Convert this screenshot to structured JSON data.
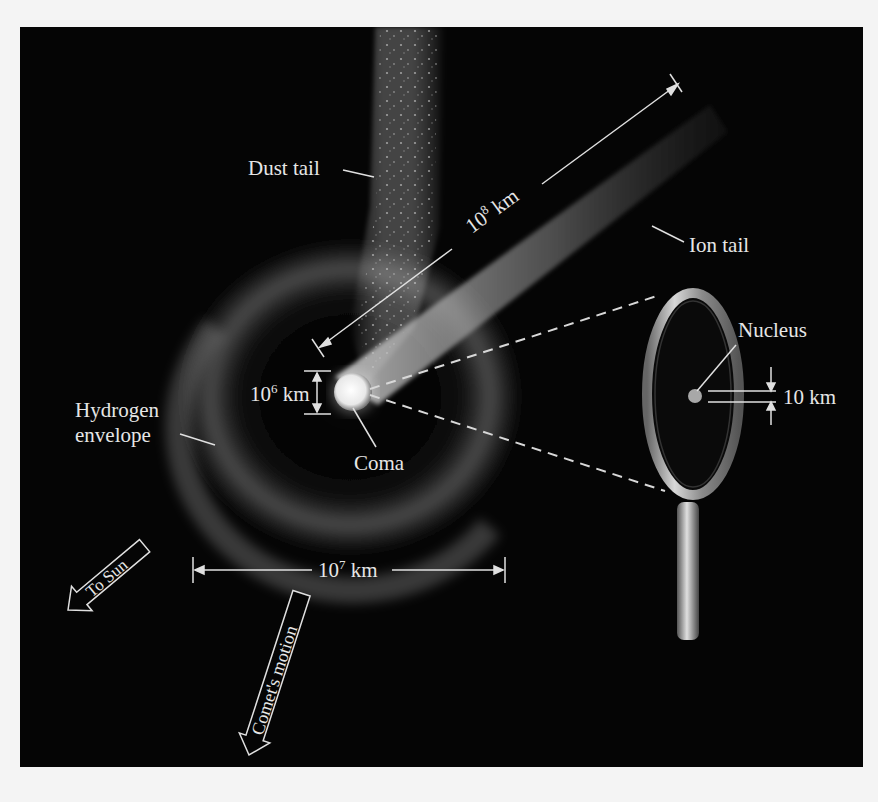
{
  "diagram": {
    "background_color": "#050505",
    "page_color": "#f4f4f4",
    "label_color": "#e6e6e6",
    "labels": {
      "dust_tail": "Dust tail",
      "ion_tail": "Ion tail",
      "hydrogen_envelope_line1": "Hydrogen",
      "hydrogen_envelope_line2": "envelope",
      "coma": "Coma",
      "nucleus": "Nucleus"
    },
    "dimensions": {
      "tail_length": {
        "base": "10",
        "exp": "8",
        "unit": "km"
      },
      "coma_size": {
        "base": "10",
        "exp": "6",
        "unit": "km"
      },
      "envelope_size": {
        "base": "10",
        "exp": "7",
        "unit": "km"
      },
      "nucleus_size": "10 km"
    },
    "arrows": {
      "to_sun": "To Sun",
      "comet_motion": "Comet's motion"
    },
    "icons": [
      "magnifying-glass-icon",
      "arrow-to-sun-icon",
      "arrow-comet-motion-icon"
    ]
  }
}
